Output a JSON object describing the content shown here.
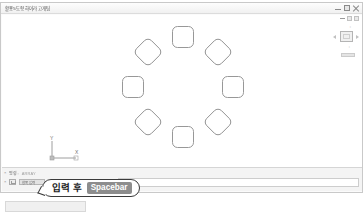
{
  "window": {
    "title": "활용5도형 하이라고개팀",
    "controls": [
      {
        "name": "minimize",
        "label": "—"
      },
      {
        "name": "maximize",
        "label": "□"
      },
      {
        "name": "close",
        "label": "✕"
      }
    ]
  },
  "navigation": {
    "top_chips": [
      "dash",
      "chip",
      "chip"
    ],
    "label": "▫",
    "sub_label": "▫",
    "viewcube_name": "ViewCube"
  },
  "ucs": {
    "y_label": "Y",
    "x_label": "X"
  },
  "command_line": {
    "row1": {
      "caret": "×",
      "prompt": "명령:",
      "value": "ARRAY"
    },
    "row2": {
      "caret": "×",
      "field_value": "항목 입력"
    },
    "input_value": ""
  },
  "callout": {
    "text": "입력 후",
    "key": "Spacebar"
  },
  "drawing": {
    "array_type": "polar",
    "item_count": 8,
    "center": {
      "x": 181,
      "y": 84
    },
    "radius": 50,
    "item_size": 21,
    "corner_radius": 5,
    "stroke_color": "#8c8c8c",
    "items": [
      {
        "angle_deg": 90,
        "rotation_deg": 0,
        "cx": 181,
        "cy": 34
      },
      {
        "angle_deg": 45,
        "rotation_deg": -45,
        "cx": 216,
        "cy": 49
      },
      {
        "angle_deg": 0,
        "rotation_deg": -90,
        "cx": 231,
        "cy": 84
      },
      {
        "angle_deg": 315,
        "rotation_deg": -135,
        "cx": 216,
        "cy": 119
      },
      {
        "angle_deg": 270,
        "rotation_deg": 180,
        "cx": 181,
        "cy": 134
      },
      {
        "angle_deg": 225,
        "rotation_deg": 135,
        "cx": 146,
        "cy": 119
      },
      {
        "angle_deg": 180,
        "rotation_deg": 90,
        "cx": 131,
        "cy": 84
      },
      {
        "angle_deg": 135,
        "rotation_deg": 45,
        "cx": 146,
        "cy": 49
      }
    ]
  }
}
